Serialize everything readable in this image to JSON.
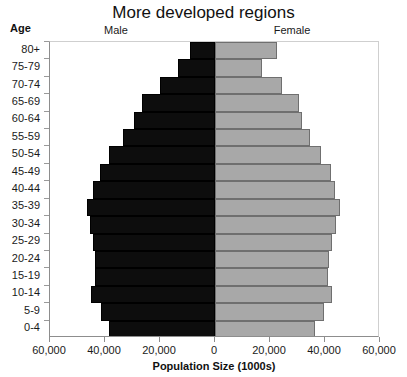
{
  "chart_data": {
    "type": "bar",
    "subtype": "population-pyramid",
    "title": "More developed regions",
    "xlabel": "Population Size (1000s)",
    "ylabel": "Age",
    "grid": false,
    "legend_position": "top",
    "axis_max": 60000,
    "xticks": [
      {
        "label": "60,000",
        "value": -60000
      },
      {
        "label": "40,000",
        "value": -40000
      },
      {
        "label": "20,000",
        "value": -20000
      },
      {
        "label": "0",
        "value": 0
      },
      {
        "label": "20,000",
        "value": 20000
      },
      {
        "label": "40,000",
        "value": 40000
      },
      {
        "label": "60,000",
        "value": 60000
      }
    ],
    "categories": [
      "80+",
      "75-79",
      "70-74",
      "65-69",
      "60-64",
      "55-59",
      "50-54",
      "45-49",
      "40-44",
      "35-39",
      "30-34",
      "25-29",
      "20-24",
      "15-19",
      "10-14",
      "5-9",
      "0-4"
    ],
    "series": [
      {
        "name": "Male",
        "color": "#0d0d0d",
        "side": "left",
        "values": [
          9000,
          13500,
          20000,
          26500,
          29500,
          33500,
          38500,
          42000,
          44500,
          46500,
          45500,
          44500,
          43500,
          43500,
          45000,
          41500,
          38500
        ]
      },
      {
        "name": "Female",
        "color": "#a8a8a8",
        "side": "right",
        "values": [
          22500,
          17000,
          24500,
          30500,
          31500,
          34500,
          38500,
          42000,
          43500,
          45500,
          44000,
          42500,
          41500,
          41000,
          42500,
          39500,
          36500
        ]
      }
    ]
  },
  "labels": {
    "age_caption": "Age",
    "male_header": "Male",
    "female_header": "Female"
  }
}
